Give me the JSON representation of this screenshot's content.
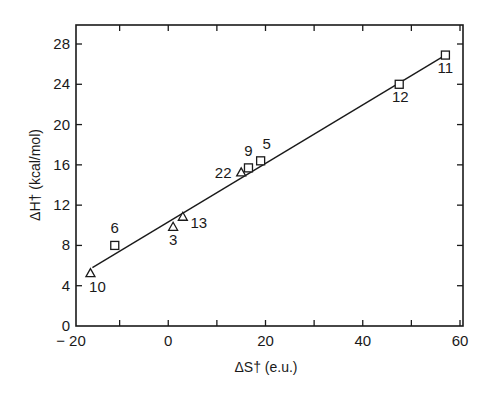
{
  "chart_data": {
    "type": "scatter",
    "title": "",
    "xlabel": "ΔS† (e.u.)",
    "ylabel": "ΔH† (kcal/mol)",
    "xlim": [
      -20,
      60
    ],
    "ylim": [
      0,
      28
    ],
    "x_ticks": [
      -20,
      0,
      20,
      40,
      60
    ],
    "x_tick_labels": [
      "− 20",
      "0",
      "20",
      "40",
      "60"
    ],
    "x_minor_ticks": [
      -10,
      10,
      30,
      50
    ],
    "y_ticks": [
      0,
      4,
      8,
      12,
      16,
      20,
      24,
      28
    ],
    "y_tick_labels": [
      "0",
      "4",
      "8",
      "12",
      "16",
      "20",
      "24",
      "28"
    ],
    "grid": false,
    "legend": "none",
    "series": [
      {
        "name": "squares",
        "marker": "square",
        "points": [
          {
            "label": "6",
            "x": -11,
            "y": 8.0
          },
          {
            "label": "9",
            "x": 16.5,
            "y": 15.7
          },
          {
            "label": "5",
            "x": 19,
            "y": 16.4
          },
          {
            "label": "12",
            "x": 47.5,
            "y": 24.0
          },
          {
            "label": "11",
            "x": 57,
            "y": 26.9
          }
        ]
      },
      {
        "name": "triangles",
        "marker": "triangle",
        "points": [
          {
            "label": "10",
            "x": -16,
            "y": 5.2
          },
          {
            "label": "3",
            "x": 1,
            "y": 9.8
          },
          {
            "label": "13",
            "x": 3,
            "y": 10.8
          },
          {
            "label": "22",
            "x": 15,
            "y": 15.2
          }
        ]
      }
    ],
    "fit_line": {
      "x": [
        -15.6,
        57
      ],
      "y": [
        5.8,
        26.9
      ]
    }
  }
}
